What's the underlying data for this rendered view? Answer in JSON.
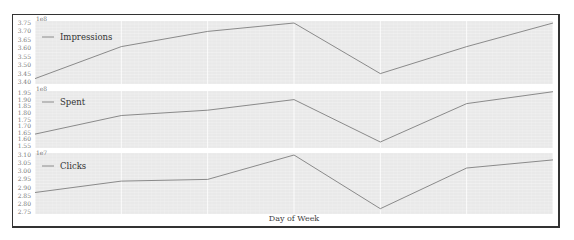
{
  "chart_data": [
    {
      "type": "line",
      "title": "",
      "legend": [
        "Impressions"
      ],
      "legend_position": "upper left",
      "x": [
        "Mon",
        "Tue",
        "Wed",
        "Thu",
        "Fri",
        "Sat",
        "Sun"
      ],
      "series": [
        {
          "name": "Impressions",
          "values": [
            3.42,
            3.61,
            3.7,
            3.75,
            3.45,
            3.61,
            3.75
          ]
        }
      ],
      "y_multiplier": "1e8",
      "ylim": [
        3.4,
        3.75
      ],
      "yticks": [
        "3.40",
        "3.45",
        "3.50",
        "3.55",
        "3.60",
        "3.65",
        "3.70",
        "3.75"
      ],
      "grid": true
    },
    {
      "type": "line",
      "title": "",
      "legend": [
        "Spent"
      ],
      "legend_position": "upper left",
      "x": [
        "Mon",
        "Tue",
        "Wed",
        "Thu",
        "Fri",
        "Sat",
        "Sun"
      ],
      "series": [
        {
          "name": "Spent",
          "values": [
            1.64,
            1.78,
            1.82,
            1.9,
            1.58,
            1.87,
            1.96
          ]
        }
      ],
      "y_multiplier": "1e8",
      "ylim": [
        1.55,
        1.95
      ],
      "yticks": [
        "1.55",
        "1.60",
        "1.65",
        "1.70",
        "1.75",
        "1.80",
        "1.85",
        "1.90",
        "1.95"
      ],
      "grid": true
    },
    {
      "type": "line",
      "title": "",
      "legend": [
        "Clicks"
      ],
      "legend_position": "upper left",
      "x": [
        "Mon",
        "Tue",
        "Wed",
        "Thu",
        "Fri",
        "Sat",
        "Sun"
      ],
      "series": [
        {
          "name": "Clicks",
          "values": [
            2.87,
            2.94,
            2.95,
            3.1,
            2.77,
            3.02,
            3.07
          ]
        }
      ],
      "y_multiplier": "1e7",
      "ylim": [
        2.75,
        3.1
      ],
      "yticks": [
        "2.75",
        "2.80",
        "2.85",
        "2.90",
        "2.95",
        "3.00",
        "3.05",
        "3.10"
      ],
      "xlabel": "Day of Week",
      "grid": true
    }
  ],
  "style": {
    "line_color": "#8a8a8a",
    "plot_bg": "#e9e9e9",
    "grid_color": "#ffffff",
    "frame_color": "#333333"
  },
  "labels": {
    "panel1_legend": "Impressions",
    "panel2_legend": "Spent",
    "panel3_legend": "Clicks",
    "panel1_mult": "1e8",
    "panel2_mult": "1e8",
    "panel3_mult": "1e7",
    "xlabel": "Day of Week"
  }
}
